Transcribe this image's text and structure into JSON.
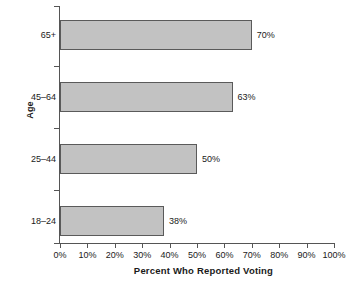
{
  "chart_data": {
    "type": "bar",
    "orientation": "horizontal",
    "title": "",
    "xlabel": "Percent Who Reported Voting",
    "ylabel": "Age",
    "categories": [
      "18–24",
      "25–44",
      "45–64",
      "65+"
    ],
    "values": [
      38,
      63,
      50,
      70
    ],
    "category_order_top_to_bottom": [
      "65+",
      "45–64",
      "25–44",
      "18–24"
    ],
    "bars": [
      {
        "category": "65+",
        "value": 70,
        "label": "70%"
      },
      {
        "category": "45–64",
        "value": 63,
        "label": "63%"
      },
      {
        "category": "25–44",
        "value": 50,
        "label": "50%"
      },
      {
        "category": "18–24",
        "value": 38,
        "label": "38%"
      }
    ],
    "xlim": [
      0,
      100
    ],
    "xticks": [
      0,
      10,
      20,
      30,
      40,
      50,
      60,
      70,
      80,
      90,
      100
    ],
    "xtick_labels": [
      "0%",
      "10%",
      "20%",
      "30%",
      "40%",
      "50%",
      "60%",
      "70%",
      "80%",
      "90%",
      "100%"
    ],
    "grid": false,
    "legend": null,
    "data_labels_shown": true,
    "colors": {
      "bar_fill": "#c2c2c2",
      "bar_border": "#5a5a5a",
      "axis": "#555555",
      "text": "#1a1a1a",
      "background": "#ffffff"
    }
  }
}
